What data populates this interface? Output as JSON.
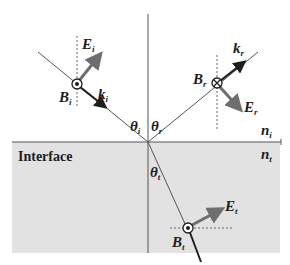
{
  "diagram": {
    "interface_label": "Interface",
    "media": {
      "upper": {
        "symbol": "n",
        "sub": "i"
      },
      "lower": {
        "symbol": "n",
        "sub": "t"
      }
    },
    "angles": {
      "incident": {
        "symbol": "θ",
        "sub": "i"
      },
      "reflected": {
        "symbol": "θ",
        "sub": "r"
      },
      "transmitted": {
        "symbol": "θ",
        "sub": "t"
      }
    },
    "waves": {
      "incident": {
        "E": {
          "symbol": "E",
          "sub": "i"
        },
        "B": {
          "symbol": "B",
          "sub": "i",
          "direction": "out-of-page"
        },
        "k": {
          "symbol": "k",
          "sub": "i"
        }
      },
      "reflected": {
        "E": {
          "symbol": "E",
          "sub": "r"
        },
        "B": {
          "symbol": "B",
          "sub": "r",
          "direction": "into-page"
        },
        "k": {
          "symbol": "k",
          "sub": "r"
        }
      },
      "transmitted": {
        "E": {
          "symbol": "E",
          "sub": "t"
        },
        "B": {
          "symbol": "B",
          "sub": "t",
          "direction": "out-of-page"
        }
      }
    },
    "colors": {
      "lower_medium_fill": "#e2e2e2",
      "line": "#555555",
      "e_arrow": "#6e6e6e",
      "k_arrow": "#1e1e1e",
      "text": "#1e1e1e"
    }
  }
}
